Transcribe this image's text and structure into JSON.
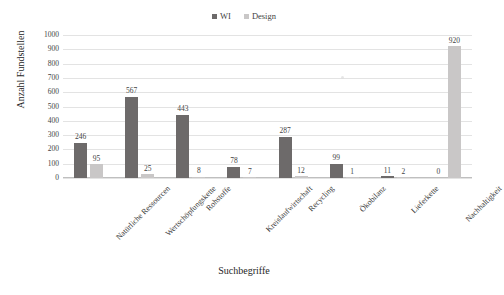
{
  "chart_data": {
    "type": "bar",
    "title": "",
    "xlabel": "Suchbegriffe",
    "ylabel": "Anzahl Fundstellen",
    "ylim": [
      0,
      1000
    ],
    "ytick_step": 100,
    "yticks": [
      0,
      100,
      200,
      300,
      400,
      500,
      600,
      700,
      800,
      900,
      1000
    ],
    "grid": "horizontal",
    "legend_position": "top-center",
    "categories": [
      "Natürliche Ressourcen",
      "Wertschöpfungskette",
      "Rohstoffe",
      "Kreislaufwirtschaft",
      "Recycling",
      "Ökobilanz",
      "Lieferkette",
      "Nachhaltigkeit"
    ],
    "series": [
      {
        "name": "WI",
        "color": "#6d6a6a",
        "values": [
          246,
          567,
          443,
          78,
          287,
          99,
          11,
          0
        ]
      },
      {
        "name": "Design",
        "color": "#c9c7c7",
        "values": [
          95,
          25,
          8,
          7,
          12,
          1,
          2,
          920
        ]
      }
    ]
  },
  "legend": {
    "entries": [
      {
        "label": "WI",
        "color": "#6d6a6a"
      },
      {
        "label": "Design",
        "color": "#c9c7c7"
      }
    ]
  },
  "axes": {
    "y_title": "Anzahl Fundstellen",
    "x_title": "Suchbegriffe",
    "y_tick_labels": [
      "1000",
      "900",
      "800",
      "700",
      "600",
      "500",
      "400",
      "300",
      "200",
      "100",
      "0"
    ]
  }
}
